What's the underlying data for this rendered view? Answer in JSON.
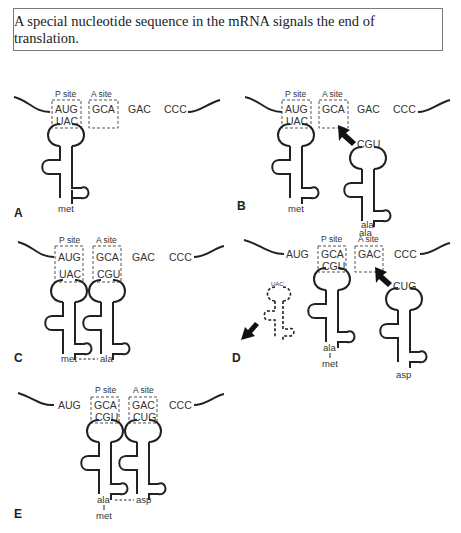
{
  "caption": "A special nucleotide sequence in the mRNA signals the end of translation.",
  "labels": {
    "p_site": "P site",
    "a_site": "A site"
  },
  "panels": {
    "A": {
      "label": "A",
      "codons": [
        "AUG",
        "GCA",
        "GAC",
        "CCC"
      ],
      "p_site_anticodon": "UAC",
      "amino_acids": [
        "met"
      ]
    },
    "B": {
      "label": "B",
      "codons": [
        "AUG",
        "GCA",
        "GAC",
        "CCC"
      ],
      "p_site_anticodon": "UAC",
      "incoming_anticodon": "CGU",
      "amino_acids": [
        "met",
        "ala"
      ]
    },
    "C": {
      "label": "C",
      "codons": [
        "AUG",
        "GCA",
        "GAC",
        "CCC"
      ],
      "p_site_anticodon": "UAC",
      "a_site_anticodon": "CGU",
      "amino_acids": [
        "met",
        "ala"
      ]
    },
    "D": {
      "label": "D",
      "codons": [
        "AUG",
        "GCA",
        "GAC",
        "CCC"
      ],
      "released_anticodon": "UAC",
      "p_site_anticodon": "CGU",
      "incoming_anticodon": "CUG",
      "top_label": "ala",
      "amino_acids": [
        "ala",
        "met",
        "asp"
      ]
    },
    "E": {
      "label": "E",
      "codons": [
        "AUG",
        "GCA",
        "GAC",
        "CCC"
      ],
      "p_site_anticodon": "CGU",
      "a_site_anticodon": "CUG",
      "amino_acids": [
        "ala",
        "met",
        "asp"
      ]
    }
  },
  "colors": {
    "line": "#222222",
    "dashed_site": "#555555",
    "border": "#7a7a7a"
  }
}
